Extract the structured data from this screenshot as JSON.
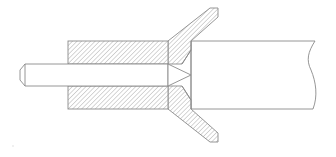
{
  "drawing": {
    "type": "technical-section-drawing",
    "description": "Cross-section of a pin inserted through a hatched collar with diagonal flared arms abutting a cylindrical body with a break line",
    "colors": {
      "background": "#ffffff",
      "line": "#8a8a8a",
      "hatch": "#9a9a9a"
    },
    "parts": [
      {
        "name": "pin",
        "label": ""
      },
      {
        "name": "collar-upper",
        "label": ""
      },
      {
        "name": "collar-lower",
        "label": ""
      },
      {
        "name": "arm-upper",
        "label": ""
      },
      {
        "name": "arm-lower",
        "label": ""
      },
      {
        "name": "body",
        "label": ""
      }
    ]
  }
}
